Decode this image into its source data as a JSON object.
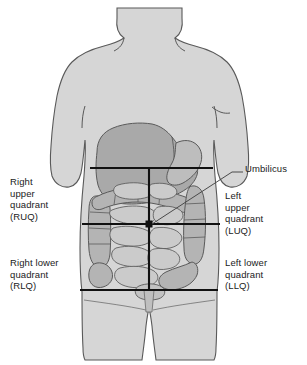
{
  "labels": {
    "ruq": "Right\nupper\nquadrant\n(RUQ)",
    "luq": "Left\nupper\nquadrant\n(LUQ)",
    "rlq": "Right lower\nquadrant\n(RLQ)",
    "llq": "Left lower\nquadrant\n(LLQ)",
    "umbilicus": "Umbilicus"
  },
  "colors": {
    "background": "#ffffff",
    "body_fill": "#d6d6d6",
    "body_outline": "#595959",
    "liver_fill": "#a9a9a9",
    "stomach_fill": "#bdbdbd",
    "colon_fill": "#b4b4b4",
    "intestine_fill": "#cbcbcb",
    "organ_outline": "#5a5a5a",
    "quadrant_line": "#111111",
    "leader_line": "#4a4a4a",
    "text": "#1b1b1b"
  },
  "geometry": {
    "umbilicus_point": {
      "x": 149,
      "y": 224
    },
    "vertical_line": {
      "x": 149,
      "y1": 168,
      "y2": 290
    },
    "horizontal_lines": [
      {
        "y": 168,
        "x1": 90,
        "x2": 213
      },
      {
        "y": 224,
        "x1": 82,
        "x2": 220
      },
      {
        "y": 290,
        "x1": 80,
        "x2": 218
      }
    ],
    "leader": {
      "x1": 152,
      "y1": 225,
      "x2": 232,
      "y2": 172,
      "x3": 243,
      "y3": 172
    }
  }
}
